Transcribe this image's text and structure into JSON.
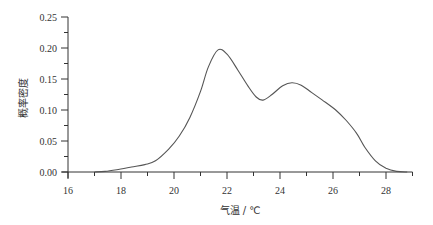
{
  "chart_data": {
    "type": "line",
    "title": "",
    "xlabel": "气温 / ℃",
    "ylabel": "概率密度",
    "xlim": [
      16,
      29
    ],
    "ylim": [
      0,
      0.25
    ],
    "x_ticks": [
      16,
      18,
      20,
      22,
      24,
      26,
      28
    ],
    "x_tick_labels": [
      "16",
      "18",
      "20",
      "22",
      "24",
      "26",
      "28"
    ],
    "x_minor_ticks": [
      17,
      19,
      21,
      23,
      25,
      27,
      29
    ],
    "y_ticks": [
      0.0,
      0.05,
      0.1,
      0.15,
      0.2,
      0.25
    ],
    "y_tick_labels": [
      "0.00",
      "0.05",
      "0.10",
      "0.15",
      "0.20",
      "0.25"
    ],
    "y_minor_ticks": [
      0.025,
      0.075,
      0.125,
      0.175,
      0.225
    ],
    "grid": false,
    "legend": null,
    "series": [
      {
        "name": "气温概率密度",
        "color": "#555555",
        "x": [
          17.0,
          17.4,
          17.9,
          18.4,
          18.9,
          19.3,
          19.8,
          20.2,
          20.6,
          21.0,
          21.3,
          21.66,
          22.0,
          22.4,
          22.8,
          23.1,
          23.36,
          23.7,
          24.1,
          24.45,
          24.8,
          25.2,
          25.6,
          26.1,
          26.5,
          26.9,
          27.2,
          27.6,
          28.0,
          28.4,
          28.8
        ],
        "values": [
          0.0,
          0.001,
          0.004,
          0.008,
          0.012,
          0.018,
          0.037,
          0.058,
          0.088,
          0.13,
          0.17,
          0.197,
          0.19,
          0.165,
          0.138,
          0.121,
          0.116,
          0.125,
          0.139,
          0.144,
          0.14,
          0.128,
          0.116,
          0.1,
          0.083,
          0.062,
          0.04,
          0.018,
          0.006,
          0.001,
          0.0
        ]
      }
    ]
  },
  "axes": {
    "xlabel": "气温 / ℃",
    "ylabel": "概率密度"
  }
}
